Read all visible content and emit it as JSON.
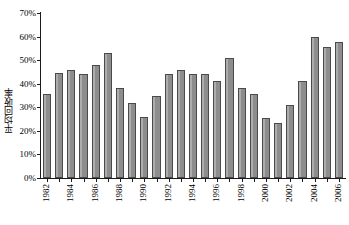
{
  "chart_data": {
    "type": "bar",
    "title": "",
    "xlabel": "",
    "ylabel": "平均回收率",
    "ylim": [
      0,
      70
    ],
    "ytick_labels": [
      "0%",
      "10%",
      "20%",
      "30%",
      "40%",
      "50%",
      "60%",
      "70%"
    ],
    "ytick_values": [
      0,
      10,
      20,
      30,
      40,
      50,
      60,
      70
    ],
    "grid": false,
    "legend": null,
    "bar_color": "#8d8d8d",
    "bar_edge_color": "#4a4a4a",
    "categories": [
      "1982",
      "1983",
      "1984",
      "1985",
      "1986",
      "1987",
      "1988",
      "1989",
      "1990",
      "1991",
      "1992",
      "1993",
      "1994",
      "1995",
      "1996",
      "1997",
      "1998",
      "1999",
      "2000",
      "2001",
      "2002",
      "2003",
      "2004",
      "2005",
      "2006"
    ],
    "xtick_labels_shown": [
      "1982",
      "",
      "1984",
      "",
      "1986",
      "",
      "1988",
      "",
      "1990",
      "",
      "1992",
      "",
      "1994",
      "",
      "1996",
      "",
      "1998",
      "",
      "2000",
      "",
      "2002",
      "",
      "2004",
      "",
      "2006"
    ],
    "values": [
      35.5,
      44.5,
      46.0,
      44.0,
      48.0,
      53.0,
      38.3,
      31.8,
      26.0,
      35.0,
      44.0,
      45.7,
      44.0,
      44.3,
      41.3,
      51.0,
      38.3,
      35.7,
      25.3,
      23.5,
      31.1,
      41.2,
      59.7,
      55.7,
      57.6
    ],
    "value_unit": "%"
  }
}
